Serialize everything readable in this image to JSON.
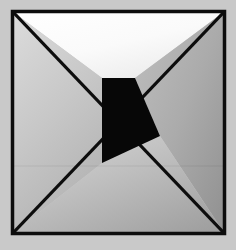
{
  "artwork": {
    "title": "Abstract Pinwheel Square",
    "description": "Square framed geometric composition with two corner-to-corner diagonals, a central black quadrilateral and four gradient-shaded regions",
    "canvas": {
      "width": 236,
      "height": 250,
      "background_color": "#c9c9c9"
    },
    "frame": {
      "name": "outer-square-frame",
      "stroke_color": "#0d0d0d",
      "stroke_width": 3.5,
      "left": 12.5,
      "top": 11.5,
      "right": 224.5,
      "bottom": 233.5
    },
    "regions": [
      {
        "name": "top-left-white-region",
        "label": "Top left white region",
        "points": "12.5,11.5 224.5,11.5 135,78 102,78 12.5,11.5",
        "fill": "white-gradient",
        "color_light": "#fdfdfd",
        "color_dark": "#eeeeee"
      },
      {
        "name": "top-right-gray-region",
        "label": "Top right medium gray region",
        "points": "224.5,11.5 224.5,233.5 160,136 135,78 224.5,11.5",
        "fill": "gray-gradient",
        "color_light": "#b4b4b4",
        "color_dark": "#9b9b9b"
      },
      {
        "name": "bottom-left-light-region",
        "label": "Bottom left light gray region",
        "points": "12.5,11.5 102,78 102,163 12.5,233.5 12.5,11.5",
        "fill": "light-gradient",
        "color_light": "#d6d6d6",
        "color_dark": "#b9b9b9"
      },
      {
        "name": "bottom-right-gray-region",
        "label": "Bottom right gray region",
        "points": "12.5,233.5 102,163 160,136 224.5,233.5 12.5,233.5",
        "fill": "midgray-gradient",
        "color_light": "#cfcfcf",
        "color_dark": "#a4a4a4"
      },
      {
        "name": "center-black-quad",
        "label": "Central black quadrilateral",
        "points": "102,78 135,78 160,136 102,163 102,78",
        "fill": "solid",
        "color_light": "#070707",
        "color_dark": "#070707"
      }
    ],
    "diagonals": [
      {
        "name": "diagonal-top-left-to-bottom-right",
        "from_x": 12.5,
        "from_y": 11.5,
        "to_x": 224.5,
        "to_y": 233.5,
        "stroke_color": "#0d0d0d",
        "stroke_width": 3.2
      },
      {
        "name": "diagonal-top-right-to-bottom-left",
        "from_x": 224.5,
        "from_y": 11.5,
        "to_x": 12.5,
        "to_y": 233.5,
        "stroke_color": "#0d0d0d",
        "stroke_width": 3.2
      }
    ],
    "seam": {
      "name": "horizontal-seam-line",
      "y": 166,
      "x_start": 13,
      "x_end": 223,
      "color": "#00000012"
    }
  }
}
